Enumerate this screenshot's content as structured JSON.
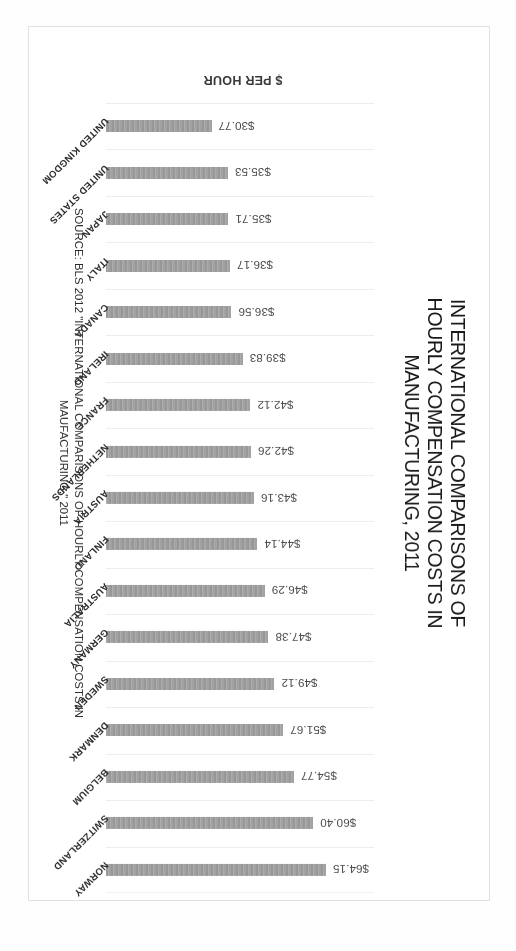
{
  "chart_data": {
    "type": "bar",
    "title": "INTERNATIONAL COMPARISONS OF HOURLY COMPENSATION COSTS IN MANUFACTURING, 2011",
    "title_lines": [
      "INTERNATIONAL COMPARISONS OF",
      "HOURLY COMPENSATION COSTS IN",
      "MANUFACTURING, 2011"
    ],
    "subtitle": "",
    "xlabel": "$ PER HOUR",
    "ylabel": "",
    "orientation": "horizontal",
    "grid": true,
    "legend": "none",
    "xlim": [
      0,
      70
    ],
    "bar_color": "#999999",
    "categories": [
      "NORWAY",
      "SWITZERLAND",
      "BELGIUM",
      "DENMARK",
      "SWEDEN",
      "GERMANY",
      "AUSTRALIA",
      "FINLAND",
      "AUSTRIA",
      "NETHERLANDS",
      "FRANCE",
      "IRELAND",
      "CANADA",
      "ITALY",
      "JAPAN",
      "UNITED STATES",
      "UNITED KINGDOM"
    ],
    "values": [
      64.15,
      60.4,
      54.77,
      51.67,
      49.12,
      47.38,
      46.29,
      44.14,
      43.16,
      42.26,
      42.12,
      39.83,
      36.56,
      36.17,
      35.71,
      35.53,
      30.77
    ],
    "value_labels": [
      "$64.15",
      "$60.40",
      "$54.77",
      "$51.67",
      "$49.12",
      "$47.38",
      "$46.29",
      "$44.14",
      "$43.16",
      "$42.26",
      "$42.12",
      "$39.83",
      "$36.56",
      "$36.17",
      "$35.71",
      "$35.53",
      "$30.77"
    ],
    "source": "SOURCE: BLS 2012 \"INTERNATIONAL COMPARISONS OF HOURLY COMPENSATION COSTS IN MAUFACTURING,\" 2011",
    "source_lines": [
      "SOURCE: BLS 2012 \"INTERNATIONAL COMPARISONS OF HOURLY COMPENSATION COSTS IN",
      "MAUFACTURING,\" 2011"
    ]
  },
  "page": {
    "axis_label": "$ PER HOUR"
  }
}
